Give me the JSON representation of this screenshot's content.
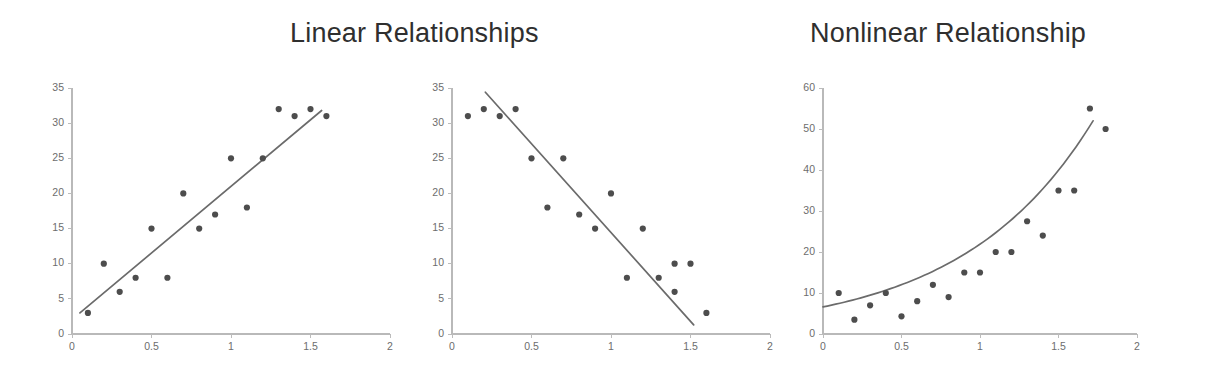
{
  "page": {
    "background": "#ffffff",
    "point_color": "#4d4d4d",
    "line_color": "#6b6b6b",
    "axis_color": "#b9b9b9",
    "tick_label_color": "#6d6d6d",
    "title_color": "#2f2f2f"
  },
  "titles": {
    "linear": "Linear Relationships",
    "nonlinear": "Nonlinear Relationship"
  },
  "chart_data": [
    {
      "id": "positive-linear",
      "type": "scatter",
      "title": "Linear Relationships",
      "subtitle": "Positive linear relationship",
      "xlabel": "",
      "ylabel": "",
      "xlim": [
        0,
        2
      ],
      "ylim": [
        0,
        35
      ],
      "xticks": [
        0,
        0.5,
        1,
        1.5,
        2
      ],
      "xticklabels": [
        "0",
        "0.5",
        "1",
        "1.5",
        "2"
      ],
      "yticks": [
        0,
        5,
        10,
        15,
        20,
        25,
        30,
        35
      ],
      "yticklabels": [
        "0",
        "5",
        "10",
        "15",
        "20",
        "25",
        "30",
        "35"
      ],
      "grid": false,
      "legend": "none",
      "x": [
        0.1,
        0.2,
        0.3,
        0.4,
        0.5,
        0.6,
        0.7,
        0.8,
        0.9,
        1.0,
        1.1,
        1.2,
        1.3,
        1.4,
        1.5,
        1.6
      ],
      "y": [
        3,
        10,
        6,
        8,
        15,
        8,
        20,
        15,
        17,
        25,
        18,
        25,
        32,
        31,
        32,
        31
      ],
      "trend": {
        "kind": "line",
        "x_start": 0.05,
        "y_start": 3.0,
        "x_end": 1.57,
        "y_end": 31.8
      }
    },
    {
      "id": "negative-linear",
      "type": "scatter",
      "title": "Linear Relationships",
      "subtitle": "Negative linear relationship",
      "xlabel": "",
      "ylabel": "",
      "xlim": [
        0,
        2
      ],
      "ylim": [
        0,
        35
      ],
      "xticks": [
        0,
        0.5,
        1,
        1.5,
        2
      ],
      "xticklabels": [
        "0",
        "0.5",
        "1",
        "1.5",
        "2"
      ],
      "yticks": [
        0,
        5,
        10,
        15,
        20,
        25,
        30,
        35
      ],
      "yticklabels": [
        "0",
        "5",
        "10",
        "15",
        "20",
        "25",
        "30",
        "35"
      ],
      "grid": false,
      "legend": "none",
      "x": [
        0.1,
        0.2,
        0.3,
        0.4,
        0.5,
        0.6,
        0.7,
        0.8,
        0.9,
        1.0,
        1.1,
        1.2,
        1.3,
        1.4,
        1.4,
        1.5,
        1.6
      ],
      "y": [
        31,
        32,
        31,
        32,
        25,
        18,
        25,
        17,
        15,
        20,
        8,
        15,
        8,
        6,
        10,
        10,
        3
      ],
      "trend": {
        "kind": "line",
        "x_start": 0.21,
        "y_start": 34.4,
        "x_end": 1.52,
        "y_end": 1.3
      }
    },
    {
      "id": "nonlinear-exponential",
      "type": "scatter",
      "title": "Nonlinear Relationship",
      "subtitle": "Exponential relationship",
      "xlabel": "",
      "ylabel": "",
      "xlim": [
        0,
        2
      ],
      "ylim": [
        0,
        60
      ],
      "xticks": [
        0,
        0.5,
        1,
        1.5,
        2
      ],
      "xticklabels": [
        "0",
        "0.5",
        "1",
        "1.5",
        "2"
      ],
      "yticks": [
        0,
        10,
        20,
        30,
        40,
        50,
        60
      ],
      "yticklabels": [
        "0",
        "10",
        "20",
        "30",
        "40",
        "50",
        "60"
      ],
      "grid": false,
      "legend": "none",
      "x": [
        0.1,
        0.2,
        0.3,
        0.4,
        0.5,
        0.6,
        0.7,
        0.8,
        0.9,
        1.0,
        1.1,
        1.2,
        1.3,
        1.4,
        1.5,
        1.6,
        1.7,
        1.8
      ],
      "y": [
        10,
        3.5,
        7,
        10,
        4.3,
        8,
        12,
        9,
        15,
        15,
        20,
        20,
        27.5,
        24,
        35,
        35,
        55,
        50
      ],
      "trend": {
        "kind": "curve",
        "a": 6.6,
        "b": 1.2,
        "x_start": 0.0,
        "x_end": 1.72,
        "samples": 64
      }
    }
  ]
}
